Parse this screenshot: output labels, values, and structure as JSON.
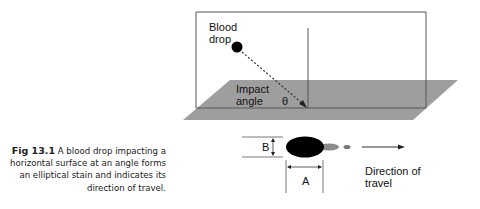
{
  "figure": {
    "labels": {
      "blood_drop_line1": "Blood",
      "blood_drop_line2": "drop",
      "impact_line1": "Impact",
      "impact_line2": "angle",
      "theta": "θ",
      "B": "B",
      "A": "A",
      "direction_line1": "Direction of",
      "direction_line2": "travel"
    },
    "colors": {
      "plane": "#9e9e9e",
      "line": "#444444",
      "stain": "#000000",
      "tail": "#8a8a8a"
    }
  },
  "caption": {
    "number": "Fig 13.1",
    "text": "A blood drop impacting a horizontal surface at an angle forms an elliptical stain and indicates its direction of travel."
  }
}
